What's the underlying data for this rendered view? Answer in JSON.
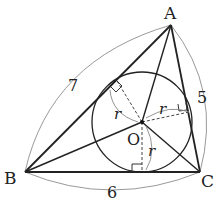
{
  "diagram": {
    "vertices": {
      "A": {
        "label": "A",
        "x": 171,
        "y": 25
      },
      "B": {
        "label": "B",
        "x": 25,
        "y": 172
      },
      "C": {
        "label": "C",
        "x": 200,
        "y": 172
      }
    },
    "incenter": {
      "label": "O",
      "x": 142,
      "y": 122,
      "radius": 50
    },
    "sides": {
      "AB": {
        "label": "7"
      },
      "AC": {
        "label": "5"
      },
      "BC": {
        "label": "6"
      }
    },
    "radius_label": "r",
    "colors": {
      "stroke": "#222222",
      "arc": "#888888",
      "background": "#ffffff"
    }
  }
}
